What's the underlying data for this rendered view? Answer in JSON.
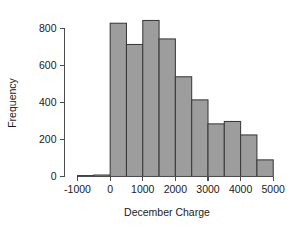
{
  "chart_data": {
    "type": "bar",
    "title": "",
    "subtitle": "",
    "xlabel": "December Charge",
    "ylabel": "Frequency",
    "bin_width": 500,
    "bin_starts": [
      -1000,
      -500,
      0,
      500,
      1000,
      1500,
      2000,
      2500,
      3000,
      3500,
      4000,
      4500
    ],
    "bin_ends": [
      -500,
      0,
      500,
      1000,
      1500,
      2000,
      2500,
      3000,
      3500,
      4000,
      4500,
      5000
    ],
    "categories": [
      "-1000 to -500",
      "-500 to 0",
      "0 to 500",
      "500 to 1000",
      "1000 to 1500",
      "1500 to 2000",
      "2000 to 2500",
      "2500 to 3000",
      "3000 to 3500",
      "3500 to 4000",
      "4000 to 4500",
      "4500 to 5000"
    ],
    "values": [
      5,
      8,
      830,
      715,
      845,
      745,
      540,
      415,
      285,
      298,
      225,
      90
    ],
    "xlim": [
      -1400,
      5300
    ],
    "ylim": [
      0,
      880
    ],
    "xticks": [
      -1000,
      0,
      1000,
      2000,
      3000,
      4000,
      5000
    ],
    "xtick_labels": [
      "-1000",
      "0",
      "1000",
      "2000",
      "3000",
      "4000",
      "5000"
    ],
    "yticks": [
      0,
      200,
      400,
      600,
      800
    ],
    "ytick_labels": [
      "0",
      "200",
      "400",
      "600",
      "800"
    ],
    "grid": false,
    "legend": "none",
    "bar_fill_color": "#9d9d9d",
    "bar_border_color": "#3a3a3a",
    "axis_color": "#4d4d4d",
    "background_color": "#ffffff"
  }
}
